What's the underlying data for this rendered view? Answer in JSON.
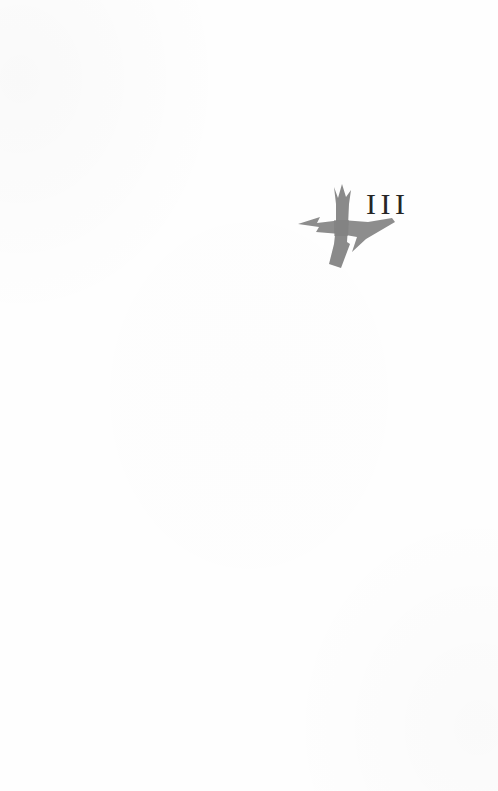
{
  "page": {
    "kind": "part-title-page",
    "background_color": "#fefefe",
    "width": 498,
    "height": 791
  },
  "part_mark": {
    "number_label": "III",
    "number_color": "#262626",
    "ornament": {
      "icon_name": "brush-stroke-cross-ornament",
      "description": "stylized gray calligraphic cross / dagger with jagged crown top and arrow-tipped horizontal stroke",
      "fill_color": "#8f8f8f",
      "shadow_color": "#a8a8a8"
    }
  }
}
